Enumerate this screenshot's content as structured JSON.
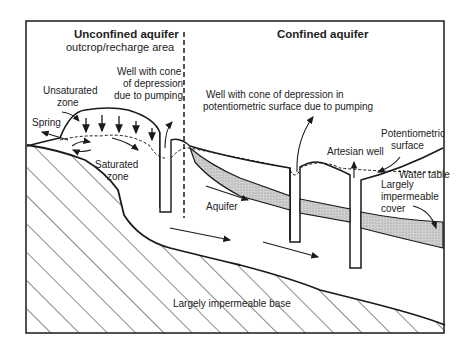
{
  "diagram": {
    "sections": {
      "unconfined_title": "Unconfined aquifer",
      "unconfined_subtitle": "outcrop/recharge area",
      "confined_title": "Confined aquifer"
    },
    "labels": {
      "well_cone_line1": "Well with cone",
      "well_cone_line2": "of depression",
      "well_cone_line3": "due to pumping",
      "unsaturated_line1": "Unsaturated",
      "unsaturated_line2": "zone",
      "spring": "Spring",
      "saturated_line1": "Saturated",
      "saturated_line2": "zone",
      "confined_well_line1": "Well with cone of depression in",
      "confined_well_line2": "potentiometric surface due to pumping",
      "potentiometric_line1": "Potentiometric",
      "potentiometric_line2": "surface",
      "artesian_well": "Artesian well",
      "water_table": "Water table",
      "cover_line1": "Largely",
      "cover_line2": "impermeable",
      "cover_line3": "cover",
      "aquifer": "Aquifer",
      "base": "Largely  impermeable base"
    },
    "colors": {
      "line": "#1a1a1a",
      "shade": "#c8c8c8",
      "background": "#ffffff"
    }
  }
}
